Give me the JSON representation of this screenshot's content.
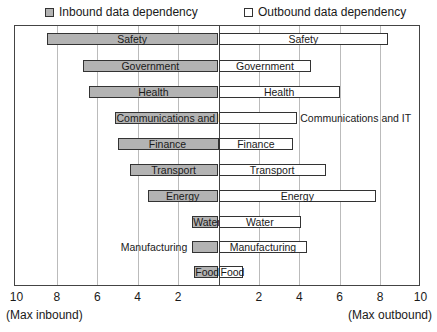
{
  "legend": {
    "inbound": {
      "label": "Inbound data dependency",
      "color": "#b3b3b3"
    },
    "outbound": {
      "label": "Outbound data dependency",
      "color": "#ffffff"
    }
  },
  "axis": {
    "left_ticks": [
      "10",
      "8",
      "6",
      "4",
      "2"
    ],
    "right_ticks": [
      "2",
      "4",
      "6",
      "8",
      "10"
    ],
    "left_note": "(Max inbound)",
    "right_note": "(Max outbound)"
  },
  "chart_data": {
    "type": "bar",
    "orientation": "horizontal-diverging",
    "title": "",
    "categories": [
      "Safety",
      "Government",
      "Health",
      "Communications and IT",
      "Finance",
      "Transport",
      "Energy",
      "Water",
      "Manufacturing",
      "Food"
    ],
    "series": [
      {
        "name": "Inbound data dependency",
        "direction": "left",
        "values": [
          8.5,
          6.7,
          6.4,
          5.1,
          5.0,
          4.4,
          3.5,
          1.3,
          1.3,
          1.2
        ]
      },
      {
        "name": "Outbound data dependency",
        "direction": "right",
        "values": [
          8.4,
          4.6,
          6.0,
          3.9,
          3.7,
          5.3,
          7.8,
          4.1,
          4.4,
          1.2
        ]
      }
    ],
    "xlabel_left": "(Max inbound)",
    "xlabel_right": "(Max outbound)",
    "xlim": [
      -10,
      10
    ],
    "xticks": [
      "10",
      "8",
      "6",
      "4",
      "2",
      "2",
      "4",
      "6",
      "8",
      "10"
    ],
    "grid": true,
    "legend_position": "top"
  }
}
